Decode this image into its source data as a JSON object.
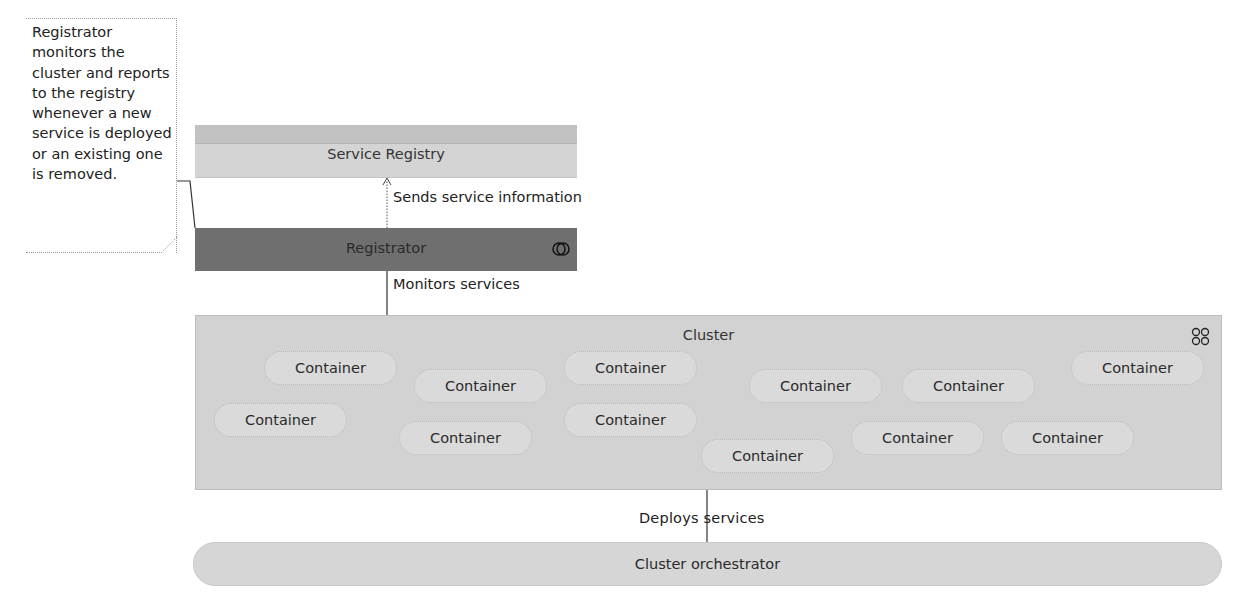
{
  "note": {
    "text": "Registrator monitors the cluster and reports to the registry whenever a new service is deployed or an existing one is removed."
  },
  "nodes": {
    "service_registry": {
      "label": "Service Registry"
    },
    "registrator": {
      "label": "Registrator",
      "icon": "process-icon"
    },
    "cluster": {
      "label": "Cluster",
      "icon": "cluster-icon"
    },
    "containers": [
      {
        "label": "Container"
      },
      {
        "label": "Container"
      },
      {
        "label": "Container"
      },
      {
        "label": "Container"
      },
      {
        "label": "Container"
      },
      {
        "label": "Container"
      },
      {
        "label": "Container"
      },
      {
        "label": "Container"
      },
      {
        "label": "Container"
      },
      {
        "label": "Container"
      },
      {
        "label": "Container"
      },
      {
        "label": "Container"
      }
    ],
    "cluster_orchestrator": {
      "label": "Cluster orchestrator"
    }
  },
  "edges": {
    "sends_service_information": {
      "label": "Sends service information",
      "from": "Registrator",
      "to": "Service Registry",
      "style": "dotted-arrow"
    },
    "monitors_services": {
      "label": "Monitors services",
      "from": "Registrator",
      "to": "Cluster",
      "style": "solid"
    },
    "deploys_services": {
      "label": "Deploys services",
      "from": "Cluster orchestrator",
      "to": "Cluster",
      "style": "solid"
    }
  },
  "colors": {
    "registry": "#d4d4d4",
    "registrator": "#6f6f6f",
    "cluster": "#d2d2d2",
    "container": "#dadada",
    "orchestrator": "#d6d6d6"
  }
}
